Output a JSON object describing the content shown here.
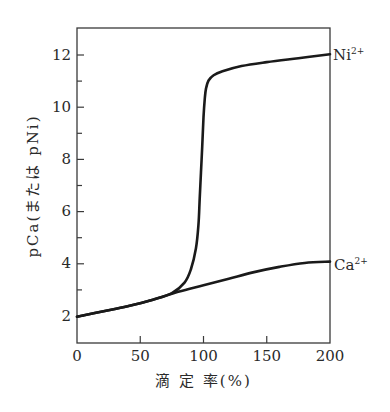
{
  "chart_data": {
    "type": "line",
    "title": "",
    "xlabel": "滴 定 率(%)",
    "ylabel": "pCa(または pNi)",
    "xlim": [
      0,
      200
    ],
    "ylim": [
      1,
      13
    ],
    "x_ticks": [
      0,
      50,
      100,
      150,
      200
    ],
    "y_ticks": [
      2,
      4,
      6,
      8,
      10,
      12
    ],
    "y_minor_ticks": [
      3,
      5,
      7,
      9,
      11
    ],
    "grid": false,
    "legend": "inline labels at right edge",
    "series": [
      {
        "name": "Ni2+",
        "label": "Ni",
        "label_sup": "2+",
        "x": [
          0,
          20,
          40,
          60,
          75,
          85,
          90,
          94,
          96,
          97,
          98,
          99,
          100,
          101,
          102,
          104,
          108,
          115,
          130,
          150,
          175,
          200
        ],
        "y": [
          2.0,
          2.2,
          2.4,
          2.65,
          2.9,
          3.3,
          3.8,
          4.6,
          5.5,
          6.5,
          7.5,
          8.5,
          9.6,
          10.3,
          10.7,
          11.0,
          11.2,
          11.35,
          11.55,
          11.7,
          11.85,
          12.0
        ]
      },
      {
        "name": "Ca2+",
        "label": "Ca",
        "label_sup": "2+",
        "x": [
          0,
          20,
          40,
          60,
          80,
          100,
          120,
          140,
          160,
          180,
          200
        ],
        "y": [
          2.0,
          2.2,
          2.4,
          2.65,
          2.95,
          3.2,
          3.45,
          3.7,
          3.9,
          4.05,
          4.1
        ]
      }
    ]
  },
  "axes": {
    "x_tick_labels": [
      "0",
      "50",
      "100",
      "150",
      "200"
    ],
    "y_tick_labels": [
      "2",
      "4",
      "6",
      "8",
      "10",
      "12"
    ],
    "x_title": "滴 定 率(%)",
    "y_title": "pCa(または pNi)"
  },
  "labels": {
    "ni": "Ni",
    "ni_sup": "2+",
    "ca": "Ca",
    "ca_sup": "2+"
  },
  "colors": {
    "line": "#1a1a1a",
    "axis": "#3a3a3a",
    "text": "#2a2a2a"
  }
}
